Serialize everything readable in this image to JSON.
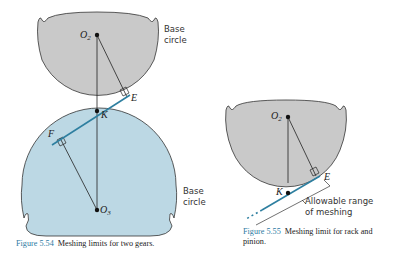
{
  "colors": {
    "driver_gear_fill": "#c9c9c9",
    "driven_gear_fill": "#bcd8e4",
    "line_of_action": "#2e7fa0",
    "outline": "#333333",
    "caption_accent": "#2c7aa3"
  },
  "figure_554": {
    "labels": {
      "o2_main": "O",
      "o2_sub": "2",
      "o3_main": "O",
      "o3_sub": "3",
      "e": "E",
      "k": "K",
      "f": "F"
    },
    "base_circle_top": [
      "Base",
      "circle"
    ],
    "base_circle_bottom": [
      "Base",
      "circle"
    ],
    "caption_number": "Figure 5.54",
    "caption_text": "Meshing limits for two gears."
  },
  "figure_555": {
    "labels": {
      "o2_main": "O",
      "o2_sub": "2",
      "e": "E",
      "k": "K"
    },
    "range_label": [
      "Allowable range",
      "of meshing"
    ],
    "caption_number": "Figure 5.55",
    "caption_text": "Meshing limit for rack and pinion."
  }
}
